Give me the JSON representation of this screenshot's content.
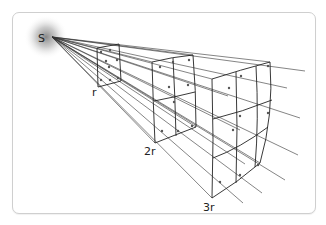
{
  "diagram": {
    "source_label": "S",
    "distance_labels": [
      "r",
      "2r",
      "3r"
    ],
    "surfaces": [
      {
        "distance": "r",
        "grid": "1x1"
      },
      {
        "distance": "2r",
        "grid": "2x2"
      },
      {
        "distance": "3r",
        "grid": "3x3"
      }
    ],
    "colors": {
      "line": "#222222",
      "glow": "#9a9a9a",
      "border": "#cfcfcf"
    }
  }
}
